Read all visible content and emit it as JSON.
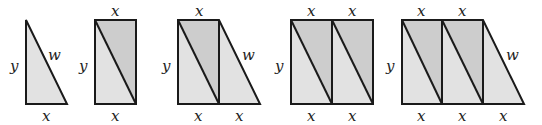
{
  "diagram": {
    "colors": {
      "light_fill": "#e2e2e2",
      "dark_fill": "#cdcdcd",
      "stroke": "#1a1a1a"
    },
    "labels": {
      "x": "x",
      "y": "y",
      "w": "w"
    },
    "figures": [
      {
        "name": "triangle",
        "top_labels": [],
        "bottom_labels": [
          "x"
        ],
        "side_label": "y",
        "hyp_label": "w"
      },
      {
        "name": "rectangle-1",
        "top_labels": [
          "x"
        ],
        "bottom_labels": [
          "x"
        ],
        "side_label": "y"
      },
      {
        "name": "trapezoid-1",
        "top_labels": [
          "x"
        ],
        "bottom_labels": [
          "x",
          "x"
        ],
        "side_label": "y",
        "hyp_label": "w"
      },
      {
        "name": "rectangle-2",
        "top_labels": [
          "x",
          "x"
        ],
        "bottom_labels": [
          "x",
          "x"
        ],
        "side_label": "y"
      },
      {
        "name": "trapezoid-2",
        "top_labels": [
          "x",
          "x"
        ],
        "bottom_labels": [
          "x",
          "x",
          "x"
        ],
        "side_label": "y",
        "hyp_label": "w"
      }
    ]
  }
}
